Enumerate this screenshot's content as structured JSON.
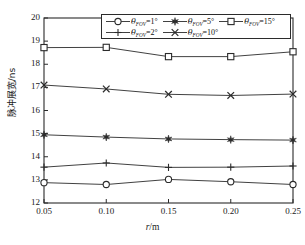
{
  "chart_data": {
    "type": "line",
    "title": "",
    "xlabel": "r/m",
    "ylabel": "脉冲展宽/ns",
    "x": [
      0.05,
      0.1,
      0.15,
      0.2,
      0.25
    ],
    "xlim": [
      0.05,
      0.25
    ],
    "ylim": [
      12,
      20
    ],
    "xticks": [
      "0.05",
      "0.10",
      "0.15",
      "0.20",
      "0.25"
    ],
    "yticks": [
      "12",
      "13",
      "14",
      "15",
      "16",
      "17",
      "18",
      "19",
      "20"
    ],
    "grid": false,
    "legend_position": "top-center-inside",
    "series": [
      {
        "name": "θFOV=1°",
        "label_theta": "θ",
        "label_sub": "FOV",
        "label_value": "=1°",
        "marker": "circle-open",
        "color": "#2b2b2b",
        "values": [
          12.88,
          12.8,
          13.02,
          12.92,
          12.8
        ]
      },
      {
        "name": "θFOV=2°",
        "label_theta": "θ",
        "label_sub": "FOV",
        "label_value": "=2°",
        "marker": "plus",
        "color": "#2b2b2b",
        "values": [
          13.55,
          13.73,
          13.54,
          13.55,
          13.6
        ]
      },
      {
        "name": "θFOV=5°",
        "label_theta": "θ",
        "label_sub": "FOV",
        "label_value": "=5°",
        "marker": "star-filled",
        "color": "#2b2b2b",
        "values": [
          14.95,
          14.85,
          14.77,
          14.74,
          14.72
        ]
      },
      {
        "name": "θFOV=10°",
        "label_theta": "θ",
        "label_sub": "FOV",
        "label_value": "=10°",
        "marker": "cross",
        "color": "#2b2b2b",
        "values": [
          17.1,
          16.93,
          16.7,
          16.65,
          16.71
        ]
      },
      {
        "name": "θFOV=15°",
        "label_theta": "θ",
        "label_sub": "FOV",
        "label_value": "=15°",
        "marker": "square-open",
        "color": "#2b2b2b",
        "values": [
          18.72,
          18.73,
          18.33,
          18.33,
          18.54
        ]
      }
    ]
  },
  "axes": {
    "xlabel_var": "r",
    "xlabel_unit": "/m",
    "ylabel_text": "脉冲展宽/ns"
  },
  "legend": {
    "row1": [
      "θFOV=1°",
      "θFOV=5°",
      "θFOV=15°"
    ],
    "row2": [
      "θFOV=2°",
      "θFOV=10°"
    ]
  }
}
